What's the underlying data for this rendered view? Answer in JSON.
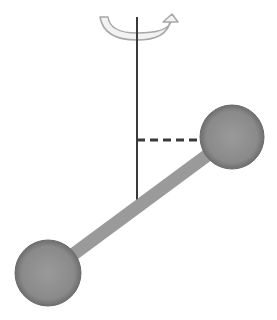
{
  "diagram": {
    "colors": {
      "background": "#ffffff",
      "axis": "#3a3a3a",
      "rod": "#9a9a9a",
      "ball_fill": "#8c8c8c",
      "ball_edge": "#6a6a6a",
      "dash": "#3a3a3a",
      "arrow_fill": "#f2f2f2",
      "arrow_stroke": "#a8a8a8"
    },
    "axis": {
      "x": 137,
      "y_top": 17,
      "y_bottom": 205
    },
    "rotation_arrow": {
      "label": "rotation-direction"
    },
    "balls": [
      {
        "name": "upper-right-mass",
        "cx": 232,
        "cy": 137,
        "r": 32
      },
      {
        "name": "lower-left-mass",
        "cx": 48,
        "cy": 273,
        "r": 33
      }
    ],
    "rod": {
      "x1": 48,
      "y1": 273,
      "x2": 232,
      "y2": 137,
      "width": 13
    },
    "dashed_distance": {
      "x1": 137,
      "y1": 140,
      "x2": 202,
      "y2": 140
    }
  }
}
